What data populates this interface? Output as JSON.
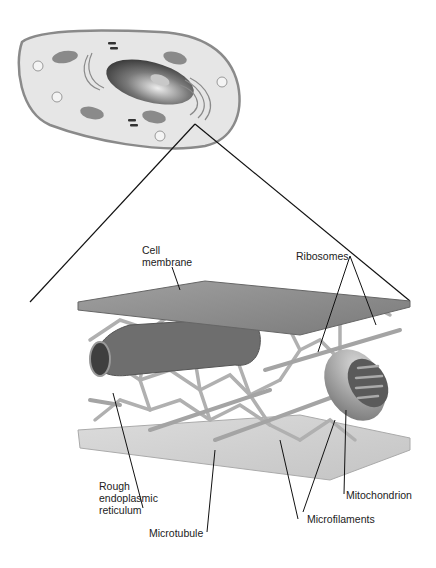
{
  "diagram": {
    "labels": {
      "cell_membrane": "Cell\nmembrane",
      "ribosomes": "Ribosomes",
      "rough_er": "Rough\nendoplasmic\nreticulum",
      "microtubule": "Microtubule",
      "microfilaments": "Microfilaments",
      "mitochondrion": "Mitochondrion"
    },
    "colors": {
      "background": "#ffffff",
      "cell_fill": "#e6e6e6",
      "cell_outline": "#8a8a8a",
      "membrane_top": "#8d8d8d",
      "membrane_bottom": "#cfcfcf",
      "filament": "#b5b5b5",
      "nucleus": "#555555",
      "leader_line": "#111111"
    }
  }
}
